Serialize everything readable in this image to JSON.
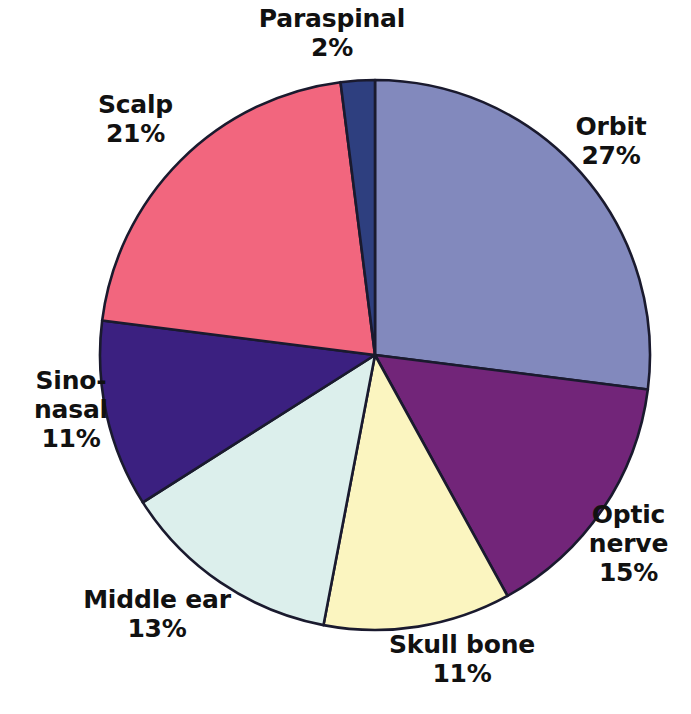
{
  "chart_data": {
    "type": "pie",
    "title": "",
    "subtitle": "",
    "xlabel": "",
    "ylabel": "",
    "legend_position": "none",
    "grid": false,
    "labels_show_percent": true,
    "start_angle_deg": 0,
    "direction": "clockwise",
    "categories": [
      "Orbit",
      "Optic nerve",
      "Skull bone",
      "Middle ear",
      "Sino-nasal",
      "Scalp",
      "Paraspinal"
    ],
    "values": [
      27,
      15,
      11,
      13,
      11,
      21,
      2
    ],
    "unit": "%",
    "colors": [
      "#8289bd",
      "#722579",
      "#fbf5c0",
      "#dcefec",
      "#3b2080",
      "#f2667e",
      "#2e3f7f"
    ],
    "slice_outline_color": "#1a1a2e",
    "slices": [
      {
        "label": "Orbit",
        "value": 27,
        "value_text": "27%",
        "color": "#8289bd"
      },
      {
        "label": "Optic nerve",
        "value": 15,
        "value_text": "15%",
        "color": "#722579"
      },
      {
        "label": "Skull bone",
        "value": 11,
        "value_text": "11%",
        "color": "#fbf5c0"
      },
      {
        "label": "Middle ear",
        "value": 13,
        "value_text": "13%",
        "color": "#dcefec"
      },
      {
        "label": "Sino-nasal",
        "value": 11,
        "value_text": "11%",
        "color": "#3b2080"
      },
      {
        "label": "Scalp",
        "value": 21,
        "value_text": "21%",
        "color": "#f2667e"
      },
      {
        "label": "Paraspinal",
        "value": 2,
        "value_text": "2%",
        "color": "#2e3f7f"
      }
    ]
  },
  "labels": {
    "paraspinal": {
      "name": "Paraspinal",
      "value": "2%"
    },
    "orbit": {
      "name": "Orbit",
      "value": "27%"
    },
    "optic": {
      "name": "Optic",
      "name2": "nerve",
      "value": "15%"
    },
    "skull": {
      "name": "Skull bone",
      "value": "11%"
    },
    "middle": {
      "name": "Middle ear",
      "value": "13%"
    },
    "sino": {
      "name": "Sino-",
      "name2": "nasal",
      "value": "11%"
    },
    "scalp": {
      "name": "Scalp",
      "value": "21%"
    }
  },
  "caption": {
    "text": ""
  },
  "palette": {
    "background": "#ffffff",
    "text": "#111111",
    "outline": "#1a1a2e"
  }
}
